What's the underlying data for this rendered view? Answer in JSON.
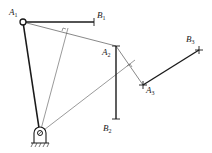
{
  "diagram": {
    "type": "four-bar linkage synthesis (inversion method)",
    "colors": {
      "thick": "#1a1a1a",
      "thin": "#555555",
      "background": "#ffffff"
    },
    "points": {
      "A1": {
        "x": 23,
        "y": 22,
        "label": "A",
        "sub": "1"
      },
      "B1": {
        "x": 94,
        "y": 22,
        "label": "B",
        "sub": "1"
      },
      "A2": {
        "x": 116,
        "y": 46,
        "label": "A",
        "sub": "2"
      },
      "B2": {
        "x": 116,
        "y": 119,
        "label": "B",
        "sub": "2"
      },
      "A3": {
        "x": 143,
        "y": 85,
        "label": "A",
        "sub": "3"
      },
      "B3": {
        "x": 199,
        "y": 50,
        "label": "B",
        "sub": "3"
      },
      "pivot": {
        "x": 40,
        "y": 133
      }
    },
    "labels": [
      {
        "id": "A1",
        "text": "A",
        "sub": "1",
        "x": 9,
        "y": 15
      },
      {
        "id": "B1",
        "text": "B",
        "sub": "1",
        "x": 97,
        "y": 18
      },
      {
        "id": "A2",
        "text": "A",
        "sub": "2",
        "x": 102,
        "y": 55
      },
      {
        "id": "B2",
        "text": "B",
        "sub": "2",
        "x": 103,
        "y": 131
      },
      {
        "id": "A3",
        "text": "A",
        "sub": "3",
        "x": 146,
        "y": 93
      },
      {
        "id": "B3",
        "text": "B",
        "sub": "3",
        "x": 186,
        "y": 42
      }
    ]
  }
}
